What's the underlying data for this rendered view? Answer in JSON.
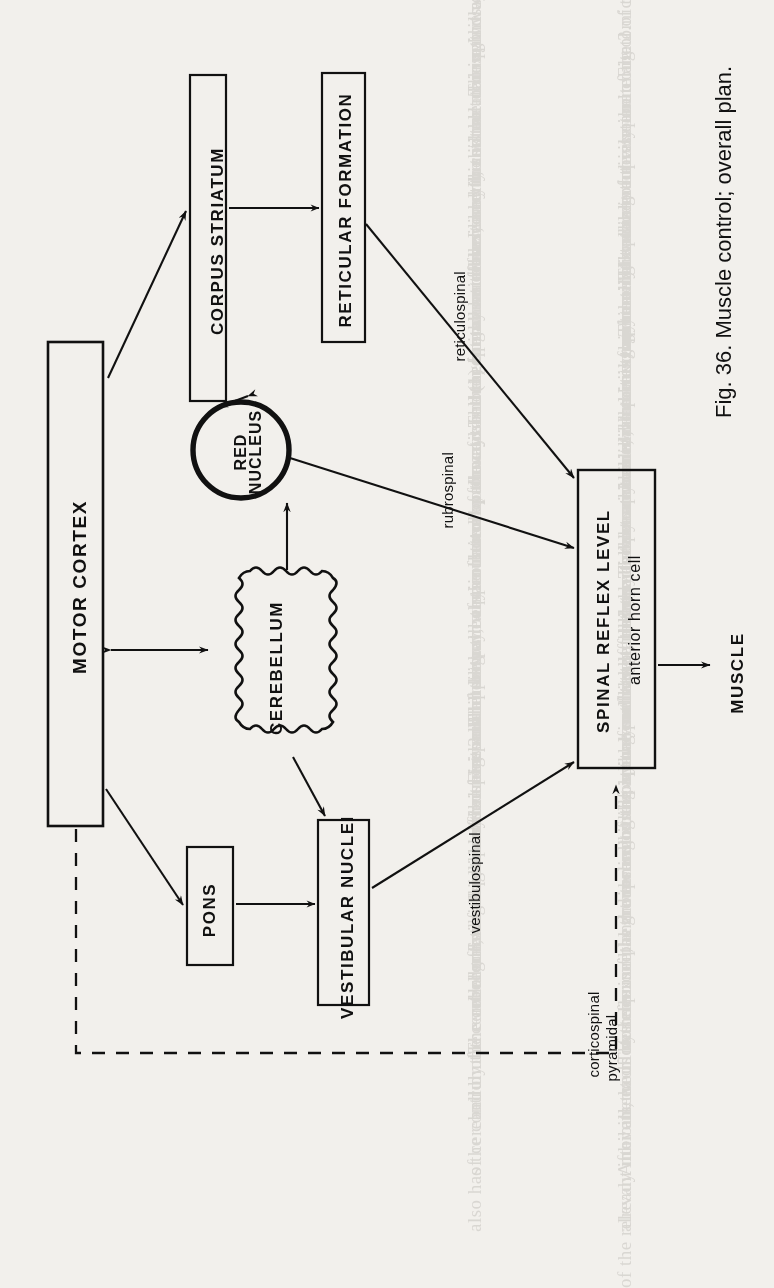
{
  "figure": {
    "caption": "Fig. 36. Muscle control; overall plan.",
    "orientation_deg": 90,
    "ink_color": "#111111",
    "paper_color": "#f2f0ec"
  },
  "nodes": [
    {
      "id": "motor-cortex",
      "label": "MOTOR CORTEX",
      "shape": "rect"
    },
    {
      "id": "corpus-striatum",
      "label": "CORPUS STRIATUM",
      "shape": "rect"
    },
    {
      "id": "reticular-formation",
      "label": "RETICULAR FORMATION",
      "shape": "rect"
    },
    {
      "id": "red-nucleus",
      "label_line1": "RED",
      "label_line2": "NUCLEUS",
      "shape": "circle"
    },
    {
      "id": "cerebellum",
      "label": "CEREBELLUM",
      "shape": "scalloped"
    },
    {
      "id": "pons",
      "label": "PONS",
      "shape": "rect"
    },
    {
      "id": "vestibular-nuclei",
      "label": "VESTIBULAR NUCLEI",
      "shape": "rect"
    },
    {
      "id": "spinal-reflex-level",
      "label": "SPINAL REFLEX LEVEL",
      "sublabel": "anterior horn cell",
      "shape": "rect"
    },
    {
      "id": "muscle",
      "label": "MUSCLE",
      "shape": "text"
    }
  ],
  "path_labels": {
    "reticulospinal": "reticulospinal",
    "rubrospinal": "rubrospinal",
    "vestibulospinal": "vestibulospinal",
    "corticospinal": "corticospinal",
    "pyramidal": "pyramidal"
  },
  "edges": [
    {
      "from": "motor-cortex",
      "to": "corpus-striatum",
      "style": "solid",
      "arrows": "one"
    },
    {
      "from": "corpus-striatum",
      "to": "reticular-formation",
      "style": "solid",
      "arrows": "one"
    },
    {
      "from": "red-nucleus",
      "to": "corpus-striatum",
      "style": "solid",
      "arrows": "both"
    },
    {
      "from": "reticular-formation",
      "to": "spinal-reflex-level",
      "style": "solid",
      "arrows": "one",
      "label": "reticulospinal"
    },
    {
      "from": "red-nucleus",
      "to": "spinal-reflex-level",
      "style": "solid",
      "arrows": "one",
      "label": "rubrospinal"
    },
    {
      "from": "cerebellum",
      "to": "red-nucleus",
      "style": "solid",
      "arrows": "one"
    },
    {
      "from": "motor-cortex",
      "to": "cerebellum",
      "style": "solid",
      "arrows": "both"
    },
    {
      "from": "motor-cortex",
      "to": "pons",
      "style": "solid",
      "arrows": "one"
    },
    {
      "from": "pons",
      "to": "vestibular-nuclei",
      "style": "solid",
      "arrows": "one"
    },
    {
      "from": "cerebellum",
      "to": "vestibular-nuclei",
      "style": "solid",
      "arrows": "one"
    },
    {
      "from": "vestibular-nuclei",
      "to": "spinal-reflex-level",
      "style": "solid",
      "arrows": "one",
      "label": "vestibulospinal"
    },
    {
      "from": "motor-cortex",
      "to": "spinal-reflex-level",
      "style": "dashed",
      "arrows": "one",
      "label": "corticospinal pyramidal"
    },
    {
      "from": "spinal-reflex-level",
      "to": "muscle",
      "style": "solid",
      "arrows": "one"
    }
  ],
  "background_text": {
    "note": "faint printed body text visible through the page",
    "lines": [
      "reflex used in this act. The spindle is not rigid, and can be in",
      "two modes. It may be stimulated in two ways:",
      "(1) It may be made directly contract through its own",
      "fusimotor or gamma fibres, and this is the main pathway;",
      "pathway. The receptor must be used by the whole course",
      "some of the cortex the general set of movement, and",
      "the collateral pathways and the spindle mechanism",
      "must be stimulated by the cerebellum for the suitable",
      "limits.",
      "Fig. 2. The diagram of the reticular formation",
      "with it at its usual pattern; a main motor command",
      "signals.",
      "Several pathways run in parallel with the upper motor",
      "neurone which is specified for some of the pathways of",
      "the cerebellum; the nucleus of the cerebellar pathway",
      "and by the control of muscle tone in the spine and limbs",
      "of cerebellum. The collaterals of the reticular nuclei",
      "also has the control of the arc regulating the limbs.",
      "",
      "The whole activity and control of the muscle",
      "The relative size of the separate anatomical",
      "and functional displacement is seen in Fig. 2.",
      "with the extrapyramidal nuclei, the relation of the",
      "pyramidal and extrapyramidal tracts to one another",
      "makes the relative position of the muscular group",
      "body to be maintained, and it is this resting state",
      "the main parts that are basic, containing generally",
      "outflow of the cerebellum and cerebral cortex, and",
      "by the nuclear pathways. The pyramidal and the",
      "corticospinal pathways are the main determinants",
      "including the spinal cord itself, and the dominant",
      "the movement itself is the final result, the structure",
      "is used as the means of the arrangement that follows",
      "The reflex of the arc through the pathways of the",
      "nervous system.",
      "After all, each of the principal groups incoming are",
      "already inhibits the motor neurone, and the result",
      "of the relevant movement of muscles."
    ]
  }
}
